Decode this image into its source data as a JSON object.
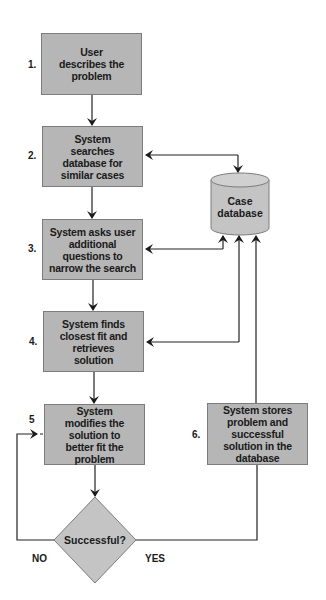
{
  "diagram": {
    "steps": [
      {
        "number": "1.",
        "text": "User describes the problem"
      },
      {
        "number": "2.",
        "text": "System searches database for similar cases"
      },
      {
        "number": "3.",
        "text": "System asks user additional questions to narrow the search"
      },
      {
        "number": "4.",
        "text": "System finds closest fit and retrieves solution"
      },
      {
        "number": "5",
        "text": "System modifies the solution to better fit the problem"
      },
      {
        "number": "6.",
        "text": "System stores problem and successful solution in the database"
      }
    ],
    "database": {
      "label": "Case database"
    },
    "decision": {
      "label": "Successful?",
      "no_label": "NO",
      "yes_label": "YES"
    },
    "colors": {
      "box_fill": "#b6b6b6",
      "box_border": "#7c7c7c",
      "line": "#222222"
    }
  }
}
